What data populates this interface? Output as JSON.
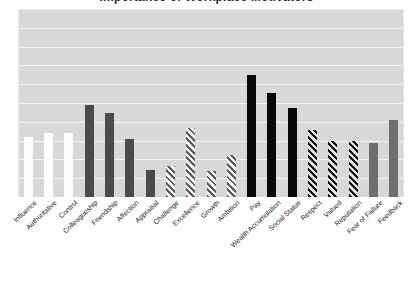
{
  "chart_data": {
    "type": "bar",
    "title": "Importance of Workplace Motivators",
    "xlabel": "",
    "ylabel": "",
    "ylim": [
      0,
      9
    ],
    "grid": true,
    "gridline_count": 9,
    "legend": null,
    "legend_position": "none",
    "categories": [
      "Influence",
      "Authoritative",
      "Control",
      "Colleagueship",
      "Friendship",
      "Affection",
      "Appraisal",
      "Challenge",
      "Excellence",
      "Growth",
      "Ambition",
      "Pay",
      "Wealth Accumulation",
      "Social Status",
      "Respect",
      "Valued",
      "Reputation",
      "Fear of Failure",
      "Feedback"
    ],
    "values": [
      2.87,
      3.06,
      3.06,
      4.4,
      4.02,
      2.78,
      1.29,
      1.48,
      3.3,
      1.24,
      2.01,
      5.84,
      4.98,
      4.26,
      3.21,
      2.68,
      2.68,
      2.58,
      3.68
    ],
    "bar_styles": [
      "white",
      "white",
      "white",
      "dark-gray",
      "dark-gray",
      "dark-gray",
      "dark-gray",
      "hatch-light",
      "hatch-light",
      "hatch-light",
      "hatch-light",
      "black",
      "black",
      "black",
      "hatch-dark",
      "hatch-dark",
      "hatch-dark",
      "mid-gray",
      "mid-gray"
    ],
    "colors": {
      "plot_background": "#d8d8d8",
      "gridline": "#f2f2f2",
      "white_bar": "#fdfdfd",
      "dark_gray_bar": "#4a4a4a",
      "black_bar": "#090909",
      "mid_gray_bar": "#6e6e6e",
      "hatch_light_stroke": "#5a5a5a",
      "hatch_dark_stroke": "#111111",
      "label_text": "#262626"
    }
  }
}
